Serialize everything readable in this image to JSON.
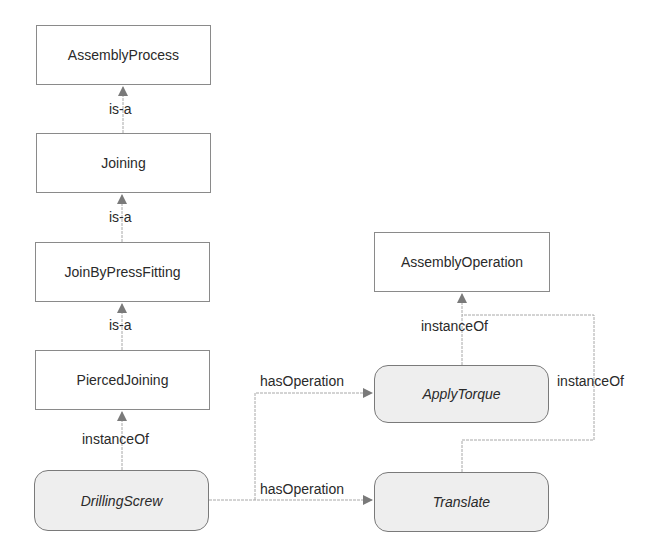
{
  "diagram": {
    "nodes": {
      "assembly_process": "AssemblyProcess",
      "joining": "Joining",
      "join_by_press_fitting": "JoinByPressFitting",
      "pierced_joining": "PiercedJoining",
      "drilling_screw": "DrillingScrew",
      "assembly_operation": "AssemblyOperation",
      "apply_torque": "ApplyTorque",
      "translate": "Translate"
    },
    "edges": {
      "joining_is_a": "is-a",
      "press_fitting_is_a": "is-a",
      "pierced_is_a": "is-a",
      "drilling_instance_of": "instanceOf",
      "apply_torque_instance_of": "instanceOf",
      "translate_instance_of": "instanceOf",
      "has_operation_apply_torque": "hasOperation",
      "has_operation_translate": "hasOperation"
    },
    "colors": {
      "class_fill": "#ffffff",
      "instance_fill": "#eeeeee",
      "edge": "#9a9a9a",
      "arrowhead": "#7a7a7a"
    }
  }
}
